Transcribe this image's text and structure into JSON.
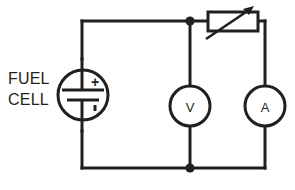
{
  "diagram": {
    "type": "electrical-schematic",
    "stroke_color": "#231f20",
    "background_color": "#ffffff",
    "source": {
      "caption_line1": "FUEL",
      "caption_line2": "CELL",
      "symbol": "battery-cell-in-circle",
      "positive_sign": "+",
      "negative_sign": "–"
    },
    "components": [
      {
        "name": "variable-resistor",
        "symbol": "rectangle-with-diagonal-arrow",
        "label": ""
      },
      {
        "name": "voltmeter",
        "symbol": "circle-meter",
        "label": "V"
      },
      {
        "name": "ammeter",
        "symbol": "circle-meter",
        "label": "A"
      }
    ],
    "junctions": [
      {
        "name": "top-node"
      },
      {
        "name": "bottom-node"
      }
    ]
  }
}
